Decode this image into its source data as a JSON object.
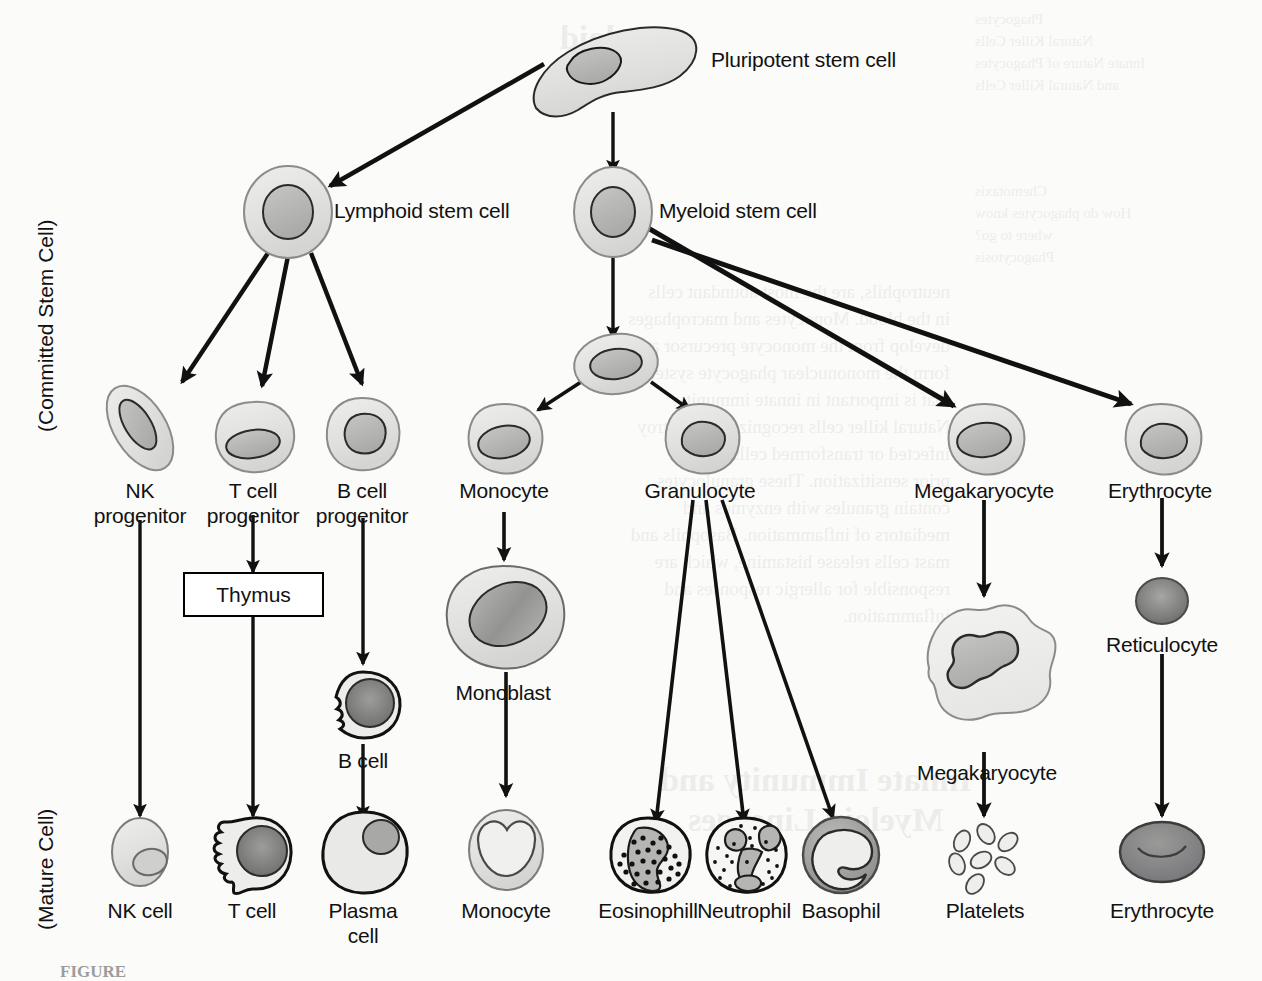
{
  "figure": {
    "axis_labels": {
      "committed": "(Committed Stem Cell)",
      "mature": "(Mature Cell)"
    },
    "caption": "FIGURE"
  },
  "colors": {
    "stroke": "#1a1a1a",
    "cytoplasm_light": "#e4e4e2",
    "cytoplasm_mid": "#d2d2d0",
    "nucleus_mid": "#b9b9b7",
    "nucleus_dark": "#8d8d8b",
    "nucleus_darker": "#6f6f6d",
    "background": "#fbfbf9",
    "box_border": "#000000"
  },
  "nodes": {
    "pluripotent": {
      "label": "Pluripotent stem cell",
      "x": 612,
      "y": 62,
      "label_x": 711,
      "label_y": 48
    },
    "lymphoid": {
      "label": "Lymphoid stem cell",
      "x": 288,
      "y": 212,
      "label_x": 335,
      "label_y": 198
    },
    "myeloid": {
      "label": "Myeloid stem cell",
      "x": 613,
      "y": 212,
      "label_x": 660,
      "label_y": 198
    },
    "nk_progenitor": {
      "label": "NK\nprogenitor",
      "x": 140,
      "y": 415,
      "label_x": 140,
      "label_y": 478
    },
    "t_progenitor": {
      "label": "T cell\nprogenitor",
      "x": 253,
      "y": 432,
      "label_x": 253,
      "label_y": 478
    },
    "b_progenitor": {
      "label": "B cell\nprogenitor",
      "x": 362,
      "y": 432,
      "label_x": 362,
      "label_y": 478
    },
    "thymus": {
      "label": "Thymus",
      "x": 253,
      "y": 594
    },
    "b_cell": {
      "label": "B cell",
      "x": 363,
      "y": 700,
      "label_x": 363,
      "label_y": 731
    },
    "plasma_cell": {
      "label": "Plasma\ncell",
      "x": 363,
      "y": 866,
      "label_x": 363,
      "label_y": 896
    },
    "myeloid_progenitor": {
      "label": "",
      "x": 616,
      "y": 372
    },
    "monocyte_precursor": {
      "label": "Monocyte",
      "x": 504,
      "y": 434,
      "label_x": 504,
      "label_y": 478
    },
    "granulocyte": {
      "label": "Granulocyte",
      "x": 700,
      "y": 434,
      "label_x": 700,
      "label_y": 478
    },
    "monoblast": {
      "label": "Monoblast",
      "x": 503,
      "y": 608,
      "label_x": 503,
      "label_y": 652
    },
    "monocyte_mature": {
      "label": "Monocyte",
      "x": 506,
      "y": 848,
      "label_x": 506,
      "label_y": 896
    },
    "eosinophil": {
      "label": "Eosinophill",
      "x": 648,
      "y": 856,
      "label_x": 648,
      "label_y": 896
    },
    "neutrophil": {
      "label": "Neutrophil",
      "x": 744,
      "y": 856,
      "label_x": 744,
      "label_y": 896
    },
    "basophil": {
      "label": "Basophil",
      "x": 841,
      "y": 856,
      "label_x": 841,
      "label_y": 896
    },
    "megakaryocyte_small": {
      "label": "Megakaryocyte",
      "x": 984,
      "y": 434,
      "label_x": 984,
      "label_y": 478
    },
    "megakaryocyte_large": {
      "label": "Megakaryocyte",
      "x": 987,
      "y": 676,
      "label_x": 987,
      "label_y": 736
    },
    "platelets": {
      "label": "Platelets",
      "x": 985,
      "y": 856,
      "label_x": 985,
      "label_y": 896
    },
    "erythrocyte_precursor": {
      "label": "Erythrocyte",
      "x": 1160,
      "y": 434,
      "label_x": 1160,
      "label_y": 478
    },
    "reticulocyte": {
      "label": "Reticulocyte",
      "x": 1162,
      "y": 601,
      "label_x": 1162,
      "label_y": 637
    },
    "erythrocyte_mature": {
      "label": "Erythrocyte",
      "x": 1162,
      "y": 852,
      "label_x": 1162,
      "label_y": 896
    }
  },
  "edges": [
    {
      "from": "pluripotent",
      "to": "lymphoid"
    },
    {
      "from": "pluripotent",
      "to": "myeloid"
    },
    {
      "from": "lymphoid",
      "to": "nk_progenitor"
    },
    {
      "from": "lymphoid",
      "to": "t_progenitor"
    },
    {
      "from": "lymphoid",
      "to": "b_progenitor"
    },
    {
      "from": "nk_progenitor",
      "to": "nk_cell"
    },
    {
      "from": "t_progenitor",
      "to": "thymus"
    },
    {
      "from": "thymus",
      "to": "t_cell"
    },
    {
      "from": "b_progenitor",
      "to": "b_cell"
    },
    {
      "from": "b_cell",
      "to": "plasma_cell"
    },
    {
      "from": "myeloid",
      "to": "myeloid_progenitor"
    },
    {
      "from": "myeloid",
      "to": "megakaryocyte_small"
    },
    {
      "from": "myeloid",
      "to": "erythrocyte_precursor"
    },
    {
      "from": "myeloid_progenitor",
      "to": "monocyte_precursor"
    },
    {
      "from": "myeloid_progenitor",
      "to": "granulocyte"
    },
    {
      "from": "monocyte_precursor",
      "to": "monoblast"
    },
    {
      "from": "monoblast",
      "to": "monocyte_mature"
    },
    {
      "from": "granulocyte",
      "to": "eosinophil"
    },
    {
      "from": "granulocyte",
      "to": "neutrophil"
    },
    {
      "from": "granulocyte",
      "to": "basophil"
    },
    {
      "from": "megakaryocyte_small",
      "to": "megakaryocyte_large"
    },
    {
      "from": "megakaryocyte_large",
      "to": "platelets"
    },
    {
      "from": "erythrocyte_precursor",
      "to": "reticulocyte"
    },
    {
      "from": "reticulocyte",
      "to": "erythrocyte_mature"
    }
  ],
  "mature_cells": {
    "nk_cell": {
      "label": "NK cell",
      "x": 140,
      "y": 852,
      "label_x": 140,
      "label_y": 896
    },
    "t_cell": {
      "label": "T cell",
      "x": 252,
      "y": 852,
      "label_x": 252,
      "label_y": 896
    }
  },
  "ghost_text": {
    "col_right_top": "Phagocytes\nNatural Killer Cells\nInnate Nature of Phagocytes\nand Natural Killer Cells",
    "col_right_mid": "Chemotaxis\nHow do phagocytes know\nwhere to go?\nPhagocytosis",
    "heading_top": "Myeloid",
    "heading_mid": "Innate Immunity and\nMyeloid Lineages",
    "para": "neutrophils, are the most abundant cells\nin the blood. Monocytes and macrophages\ndevelop from the monocyte precursor and\nform the mononuclear phagocyte system\nthat is important in innate immunity.\nNatural killer cells recognize and destroy\ninfected or transformed cells without\nprior sensitization. These granulocytes\ncontain granules with enzymes and\nmediators of inflammation. Basophils and\nmast cells release histamine, which are\nresponsible for allergic responses and\ninflammation."
  }
}
